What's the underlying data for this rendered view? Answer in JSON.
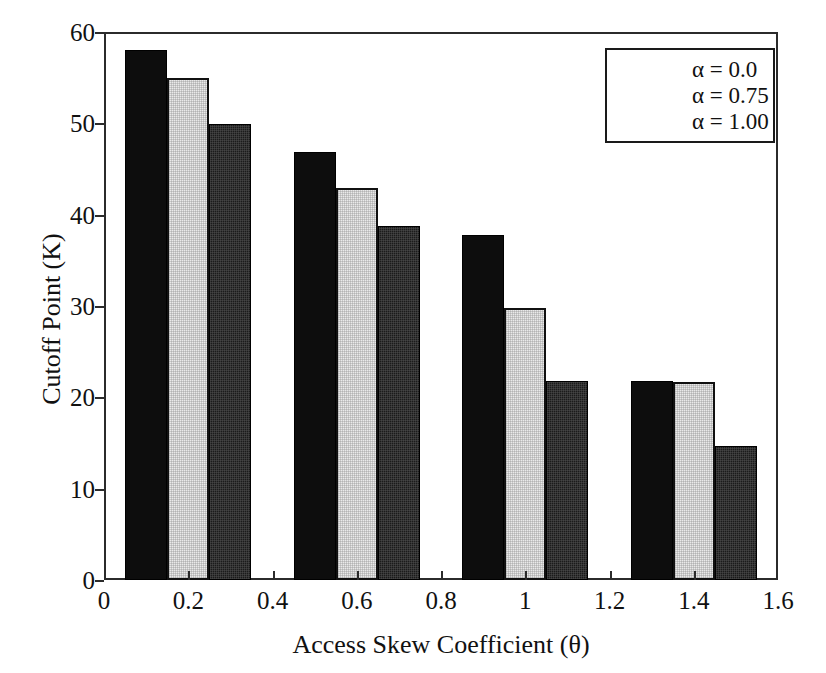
{
  "chart_data": {
    "type": "bar",
    "title": "",
    "xlabel": "Access Skew Coefficient (θ)",
    "ylabel": "Cutoff Point (K)",
    "categories": [
      "0.2",
      "0.6",
      "1",
      "1.4"
    ],
    "series": [
      {
        "name": "α = 0.0",
        "values": [
          58.0,
          46.9,
          37.8,
          21.8
        ],
        "color": "#0d0d0d"
      },
      {
        "name": "α = 0.75",
        "values": [
          55.0,
          42.9,
          29.8,
          21.7
        ],
        "color": "#e9e9e9"
      },
      {
        "name": "α = 1.00",
        "values": [
          49.9,
          38.8,
          21.8,
          14.7
        ],
        "color": "#1b1b1b"
      }
    ],
    "xlim": [
      0,
      1.6
    ],
    "ylim": [
      0,
      60
    ],
    "xticks": [
      0,
      0.2,
      0.4,
      0.6,
      0.8,
      1,
      1.2,
      1.4,
      1.6
    ],
    "xticklabels": [
      "0",
      "0.2",
      "0.4",
      "0.6",
      "0.8",
      "1",
      "1.2",
      "1.4",
      "1.6"
    ],
    "yticks": [
      0,
      10,
      20,
      30,
      40,
      50,
      60
    ],
    "yticklabels": [
      "0",
      "10",
      "20",
      "30",
      "40",
      "50",
      "60"
    ],
    "grid": false,
    "legend_position": "upper right",
    "bar_group_centers": [
      0.2,
      0.6,
      1.0,
      1.4
    ],
    "bar_width_units": 0.1
  },
  "legend": {
    "entries": [
      {
        "label": "α = 0.0"
      },
      {
        "label": "α = 0.75"
      },
      {
        "label": "α = 1.00"
      }
    ]
  },
  "axes": {
    "x_title": "Access Skew Coefficient (θ)",
    "y_title": "Cutoff Point (K)"
  }
}
